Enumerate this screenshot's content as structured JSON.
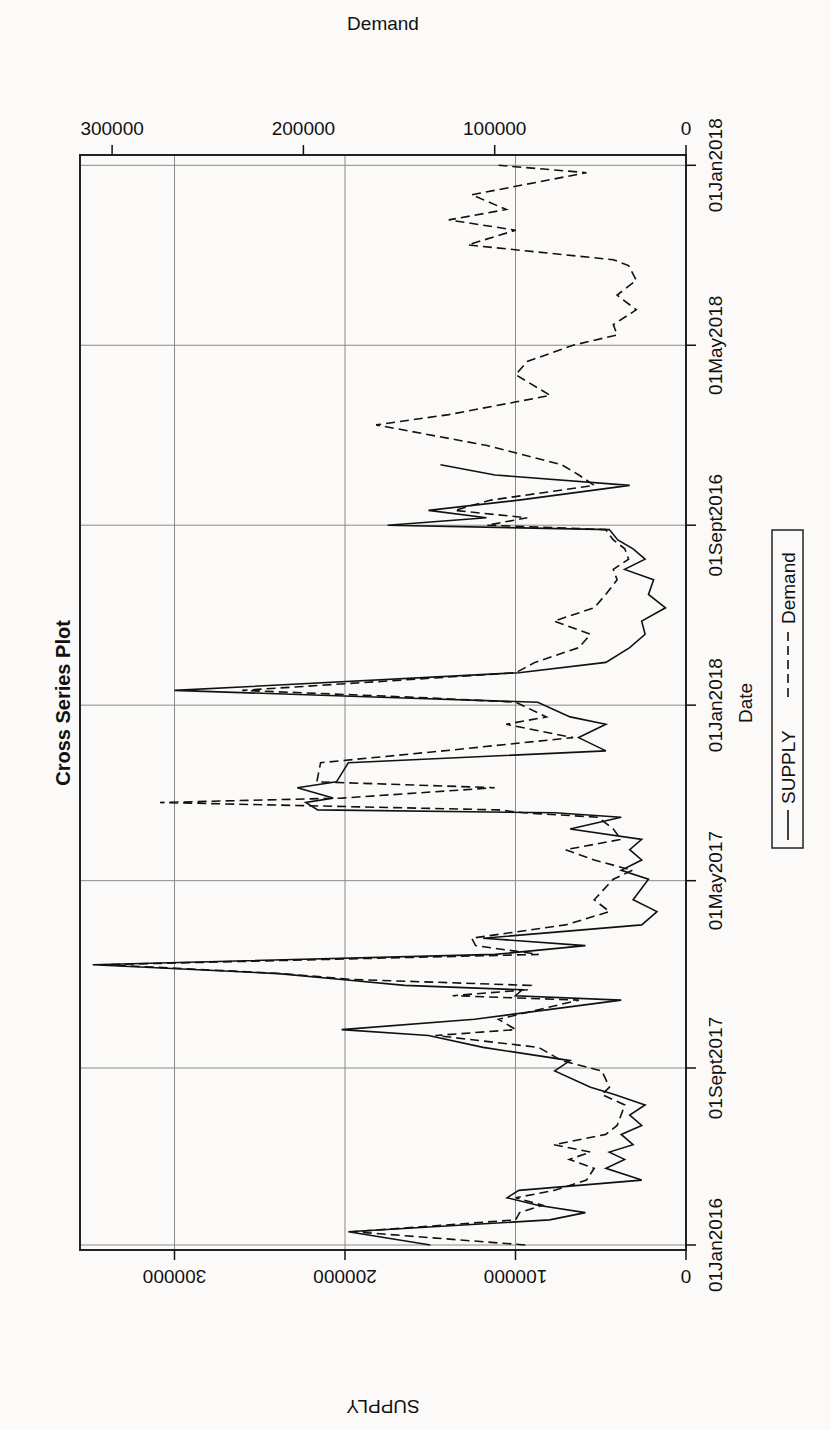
{
  "chart_data": {
    "type": "line",
    "title": "Cross Series Plot",
    "xlabel": "Date",
    "ylabel_left": "SUPPLY",
    "ylabel_right": "Demand",
    "orientation_note": "figure rotated 90 degrees counterclockwise on page",
    "x_ticks": [
      "01Jan2016",
      "01Sept2017",
      "01May2017",
      "01Jan2018",
      "01Sept2016",
      "01May2018",
      "01Jan2018"
    ],
    "x_tick_day_offsets": [
      0,
      120,
      247,
      366,
      488,
      610,
      732
    ],
    "y_left_ticks": [
      0,
      100000,
      200000,
      300000
    ],
    "y_right_ticks": [
      0,
      100000,
      200000,
      300000
    ],
    "y_left_range": [
      0,
      355000
    ],
    "y_right_range": [
      0,
      316000
    ],
    "grid": true,
    "legend": {
      "position": "bottom",
      "entries": [
        {
          "name": "SUPPLY",
          "style": "solid"
        },
        {
          "name": "Demand",
          "style": "dashed"
        }
      ]
    },
    "x_unit": "approx. days after first tick",
    "series": [
      {
        "name": "SUPPLY",
        "axis": "left",
        "style": "solid",
        "x": [
          0,
          9,
          17,
          22,
          27,
          32,
          37,
          44,
          52,
          58,
          63,
          68,
          75,
          81,
          88,
          95,
          102,
          107,
          118,
          125,
          134,
          142,
          146,
          153,
          166,
          169,
          173,
          176,
          180,
          184,
          190,
          197,
          203,
          208,
          217,
          226,
          234,
          248,
          254,
          261,
          268,
          275,
          282,
          290,
          293,
          295,
          300,
          303,
          310,
          314,
          327,
          335,
          344,
          353,
          358,
          368,
          371,
          376,
          388,
          395,
          405,
          414,
          423,
          432,
          441,
          451,
          458,
          465,
          472,
          478,
          485,
          488,
          493,
          498,
          505,
          515,
          522,
          529
        ],
        "values": [
          150000,
          198000,
          80000,
          59000,
          87000,
          105000,
          98000,
          26000,
          47000,
          36000,
          45000,
          31000,
          38000,
          26000,
          33000,
          24000,
          42000,
          56000,
          77000,
          68000,
          119000,
          151000,
          202000,
          124000,
          38000,
          100000,
          96000,
          165000,
          202000,
          239000,
          348000,
          112000,
          59000,
          119000,
          26000,
          17000,
          31000,
          22000,
          38000,
          26000,
          33000,
          26000,
          68000,
          38000,
          77000,
          216000,
          223000,
          207000,
          228000,
          205000,
          198000,
          47000,
          63000,
          47000,
          68000,
          87000,
          170000,
          300000,
          98000,
          47000,
          33000,
          24000,
          26000,
          12000,
          22000,
          19000,
          36000,
          24000,
          31000,
          40000,
          45000,
          175000,
          117000,
          151000,
          98000,
          33000,
          112000,
          144000
        ]
      },
      {
        "name": "Demand",
        "axis": "right",
        "style": "dashed",
        "x": [
          0,
          9,
          17,
          22,
          27,
          32,
          37,
          44,
          52,
          58,
          63,
          68,
          75,
          81,
          88,
          95,
          102,
          107,
          118,
          125,
          134,
          142,
          146,
          153,
          166,
          169,
          173,
          176,
          180,
          184,
          190,
          197,
          203,
          208,
          217,
          226,
          234,
          248,
          254,
          261,
          268,
          275,
          282,
          290,
          293,
          295,
          300,
          303,
          310,
          314,
          327,
          335,
          344,
          353,
          358,
          368,
          371,
          376,
          388,
          395,
          405,
          414,
          423,
          432,
          441,
          451,
          458,
          465,
          472,
          478,
          485,
          488,
          493,
          498,
          505,
          515,
          522,
          529,
          542,
          556,
          563,
          576,
          590,
          599,
          610,
          617,
          624,
          634,
          644,
          654,
          664,
          668,
          678,
          688,
          695,
          702,
          712,
          727,
          732
        ],
        "values": [
          84000,
          174000,
          89000,
          87000,
          75000,
          89000,
          69000,
          52000,
          48000,
          61000,
          50000,
          69000,
          42000,
          36000,
          34000,
          32000,
          44000,
          40000,
          44000,
          65000,
          77000,
          131000,
          89000,
          98000,
          56000,
          122000,
          83000,
          81000,
          174000,
          211000,
          304000,
          77000,
          110000,
          112000,
          63000,
          40000,
          48000,
          38000,
          28000,
          48000,
          63000,
          34000,
          38000,
          46000,
          85000,
          98000,
          275000,
          180000,
          100000,
          193000,
          191000,
          127000,
          59000,
          94000,
          73000,
          89000,
          135000,
          232000,
          89000,
          79000,
          56000,
          50000,
          69000,
          48000,
          42000,
          36000,
          38000,
          30000,
          32000,
          38000,
          42000,
          104000,
          83000,
          121000,
          102000,
          48000,
          56000,
          65000,
          104000,
          162000,
          124000,
          71000,
          89000,
          83000,
          59000,
          36000,
          38000,
          26000,
          36000,
          26000,
          30000,
          38000,
          114000,
          89000,
          124000,
          94000,
          112000,
          52000,
          98000
        ]
      }
    ]
  },
  "chart": {
    "title": "Cross Series Plot",
    "xlabel": "Date",
    "ylabel_left": "SUPPLY",
    "ylabel_right": "Demand",
    "x_ticks": [
      "01Jan2016",
      "01Sept2017",
      "01May2017",
      "01Jan2018",
      "01Sept2016",
      "01May2018",
      "01Jan2018"
    ],
    "y_left_ticks": [
      "0",
      "100000",
      "200000",
      "300000"
    ],
    "y_right_ticks": [
      "0",
      "100000",
      "200000",
      "300000"
    ],
    "legend_supply": "SUPPLY",
    "legend_demand": "Demand",
    "legend_line_supply": "———",
    "legend_line_demand": "- - - -"
  }
}
